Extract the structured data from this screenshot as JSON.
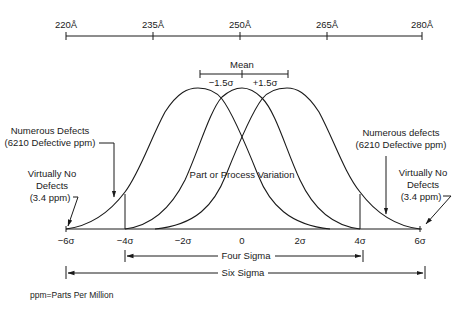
{
  "angstrom_scale": {
    "ticks": [
      {
        "label": "220Å",
        "x": 66
      },
      {
        "label": "235Å",
        "x": 153
      },
      {
        "label": "250Å",
        "x": 240
      },
      {
        "label": "265Å",
        "x": 327
      },
      {
        "label": "280Å",
        "x": 422
      }
    ]
  },
  "mean_bracket": {
    "title": "Mean",
    "left_label": "−1.5σ",
    "right_label": "+1.5σ"
  },
  "sigma_axis": {
    "ticks": [
      {
        "label": "−6σ",
        "x": 66
      },
      {
        "label": "−4σ",
        "x": 125
      },
      {
        "label": "−2σ",
        "x": 183
      },
      {
        "label": "0",
        "x": 242
      },
      {
        "label": "2σ",
        "x": 300
      },
      {
        "label": "4σ",
        "x": 360
      },
      {
        "label": "6σ",
        "x": 420
      }
    ]
  },
  "annotations": {
    "left_numerous_line1": "Numerous Defects",
    "left_numerous_line2": "(6210 Defective ppm)",
    "left_virtually_line1": "Virtually No",
    "left_virtually_line2": "Defects",
    "left_virtually_line3": "(3.4 ppm)",
    "right_numerous_line1": "Numerous defects",
    "right_numerous_line2": "(6210 Defective ppm)",
    "right_virtually_line1": "Virtually No",
    "right_virtually_line2": "Defects",
    "right_virtually_line3": "(3.4 ppm)",
    "center_label": "Part or Process Variation"
  },
  "ranges": {
    "four_sigma": "Four Sigma",
    "six_sigma": "Six Sigma"
  },
  "footnote": "ppm=Parts Per Million"
}
